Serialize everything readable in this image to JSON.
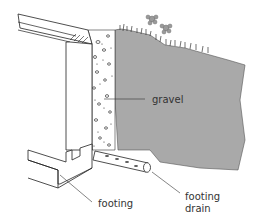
{
  "diagram": {
    "type": "cross-section illustration",
    "labels": {
      "gravel": "gravel",
      "footing": "footing",
      "drain_line1": "footing",
      "drain_line2": "drain"
    },
    "colors": {
      "soil": "#a8a8a8",
      "line": "#222222",
      "background": "#ffffff",
      "flower": "#999999"
    }
  }
}
